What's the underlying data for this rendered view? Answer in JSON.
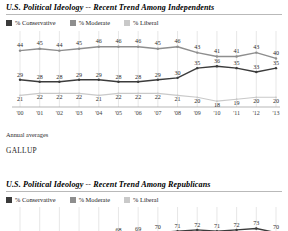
{
  "colors": {
    "conservative": "#3b3b3b",
    "moderate": "#8e8e8e",
    "liberal": "#c9c9c9",
    "gridline": "#cfcfcf",
    "axis": "#9a9a9a",
    "rule": "#b9b9b9"
  },
  "charts": [
    {
      "title": "U.S. Political Ideology -- Recent Trend Among Independents",
      "legend": [
        {
          "label": "% Conservative",
          "swatch": "conservative"
        },
        {
          "label": "% Moderate",
          "swatch": "moderate"
        },
        {
          "label": "% Liberal",
          "swatch": "liberal"
        }
      ],
      "note": "Annual averages",
      "source": "GALLUP"
    },
    {
      "title": "U.S. Political Ideology -- Recent Trend Among Republicans",
      "legend": [
        {
          "label": "% Conservative",
          "swatch": "conservative"
        },
        {
          "label": "% Moderate",
          "swatch": "moderate"
        },
        {
          "label": "% Liberal",
          "swatch": "liberal"
        }
      ],
      "note": "",
      "source": ""
    }
  ],
  "chart_data": [
    {
      "type": "line",
      "title": "U.S. Political Ideology -- Recent Trend Among Independents",
      "xlabel": "",
      "ylabel": "",
      "grid": true,
      "legend_position": "top-left",
      "categories": [
        "'00",
        "'01",
        "'02",
        "'03",
        "'04",
        "'05",
        "'06",
        "'07",
        "'08",
        "'09",
        "'10",
        "'11",
        "'12",
        "'13"
      ],
      "ylim": [
        15,
        50
      ],
      "series": [
        {
          "name": "% Moderate",
          "values": [
            44,
            45,
            44,
            45,
            46,
            46,
            46,
            45,
            46,
            43,
            41,
            41,
            43,
            40
          ]
        },
        {
          "name": "% Conservative",
          "values": [
            29,
            28,
            28,
            29,
            29,
            28,
            28,
            29,
            30,
            35,
            36,
            35,
            33,
            35
          ]
        },
        {
          "name": "% Liberal",
          "values": [
            21,
            22,
            22,
            22,
            21,
            22,
            22,
            22,
            21,
            20,
            18,
            19,
            20,
            20
          ]
        }
      ]
    },
    {
      "type": "line",
      "title": "U.S. Political Ideology -- Recent Trend Among Republicans",
      "xlabel": "",
      "ylabel": "",
      "grid": true,
      "legend_position": "top-left",
      "categories": [
        "'00",
        "'01",
        "'02",
        "'03",
        "'04",
        "'05",
        "'06",
        "'07",
        "'08",
        "'09",
        "'10",
        "'11",
        "'12",
        "'13"
      ],
      "ylim": [
        55,
        80
      ],
      "series": [
        {
          "name": "% Conservative",
          "values": [
            62,
            63,
            64,
            65,
            66,
            68,
            69,
            70,
            71,
            72,
            71,
            72,
            73,
            70
          ]
        }
      ]
    }
  ]
}
